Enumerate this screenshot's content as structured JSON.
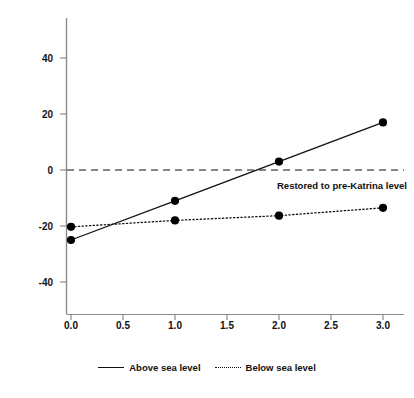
{
  "chart_data": {
    "type": "line",
    "title": "",
    "xlabel": "Civic organizational density",
    "ylabel": "Percent change in population",
    "xlim": [
      -0.12,
      3.18
    ],
    "ylim": [
      -52,
      52
    ],
    "xticks": [
      "0.0",
      "0.5",
      "1.0",
      "1.5",
      "2.0",
      "2.5",
      "3.0"
    ],
    "xtick_values": [
      0.0,
      0.5,
      1.0,
      1.5,
      2.0,
      2.5,
      3.0
    ],
    "yticks": [
      "40",
      "20",
      "0",
      "-20",
      "-40"
    ],
    "ytick_values": [
      40,
      20,
      0,
      -20,
      -40
    ],
    "grid": false,
    "legend_position": "bottom-center",
    "x": [
      0.0,
      1.0,
      2.0,
      3.0
    ],
    "series": [
      {
        "name": "Above sea level",
        "style": "solid",
        "marker": "filled-circle",
        "values": [
          -25.0,
          -11.0,
          3.0,
          17.0
        ]
      },
      {
        "name": "Below sea level",
        "style": "dotted",
        "marker": "filled-circle",
        "values": [
          -20.3,
          -18.0,
          -16.3,
          -13.5
        ]
      }
    ],
    "reference_lines": [
      {
        "name": "pre-katrina-level",
        "value": 0,
        "style": "dashed",
        "label": "Restored to pre-Katrina level"
      }
    ],
    "colors": {
      "line": "#111111",
      "axis": "#808080",
      "marker": "#000000",
      "background": "#ffffff"
    }
  }
}
